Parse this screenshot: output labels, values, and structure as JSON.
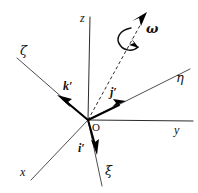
{
  "figure": {
    "background_color": "#ffffff",
    "line_color": "#2b2b2b",
    "vector_color": "#000000",
    "width": 198,
    "height": 193
  },
  "origin": {
    "label": "O",
    "x": 88,
    "y": 120
  },
  "fixed_axes": [
    {
      "name": "z-axis",
      "label": "z",
      "label_x": 80,
      "label_y": 12,
      "tip_x": 90,
      "tip_y": 17
    },
    {
      "name": "y-axis",
      "label": "y",
      "label_x": 174,
      "label_y": 124,
      "tip_x": 193,
      "tip_y": 121
    },
    {
      "name": "x-axis",
      "label": "x",
      "label_x": 20,
      "label_y": 166,
      "tip_x": 31,
      "tip_y": 180
    }
  ],
  "rotating_axes": [
    {
      "name": "zeta-axis",
      "label": "ζ",
      "label_x": 20,
      "label_y": 44,
      "tip_x": 17,
      "tip_y": 58
    },
    {
      "name": "eta-axis",
      "label": "η",
      "label_x": 176,
      "label_y": 71,
      "tip_x": 190,
      "tip_y": 69
    },
    {
      "name": "xi-axis",
      "label": "ξ",
      "label_x": 105,
      "label_y": 164,
      "tip_x": 102,
      "tip_y": 186
    }
  ],
  "unit_vectors": [
    {
      "name": "i-prime-vector",
      "label": "i′",
      "label_x": 78,
      "label_y": 142,
      "tip_x": 96,
      "tip_y": 153
    },
    {
      "name": "j-prime-vector",
      "label": "j′",
      "label_x": 110,
      "label_y": 86,
      "tip_x": 121,
      "tip_y": 106
    },
    {
      "name": "k-prime-vector",
      "label": "k′",
      "label_x": 63,
      "label_y": 80,
      "tip_x": 60,
      "tip_y": 101
    }
  ],
  "angular_velocity": {
    "name": "omega-vector",
    "label": "ω",
    "label_x": 146,
    "label_y": 22,
    "tip_x": 147,
    "tip_y": 13,
    "style": "dashed",
    "rotation_arc": "counterclockwise"
  }
}
